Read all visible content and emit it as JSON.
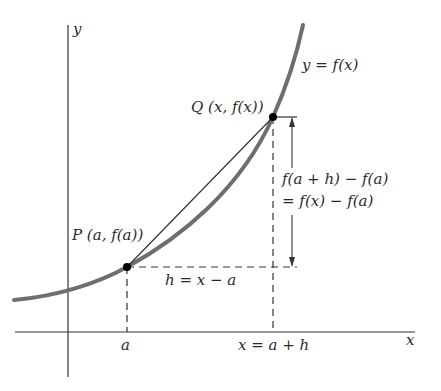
{
  "diagram": {
    "type": "secant-line-on-curve",
    "colors": {
      "curve": "#6e6e6e",
      "axes": "#333333",
      "secant": "#333333",
      "dashed": "#333333",
      "points": "#000000",
      "background": "#ffffff"
    },
    "axes": {
      "x_label": "x",
      "y_label": "y"
    },
    "curve": {
      "label": "y  = f(x)"
    },
    "points": {
      "P": {
        "label": "P (a, f(a))"
      },
      "Q": {
        "label": "Q (x, f(x))"
      }
    },
    "ticks": {
      "a": "a",
      "x": "x = a + h"
    },
    "annotations": {
      "horizontal_gap": "h = x − a",
      "vertical_gap_line1": "f(a + h) − f(a)",
      "vertical_gap_line2": "= f(x) − f(a)"
    }
  }
}
